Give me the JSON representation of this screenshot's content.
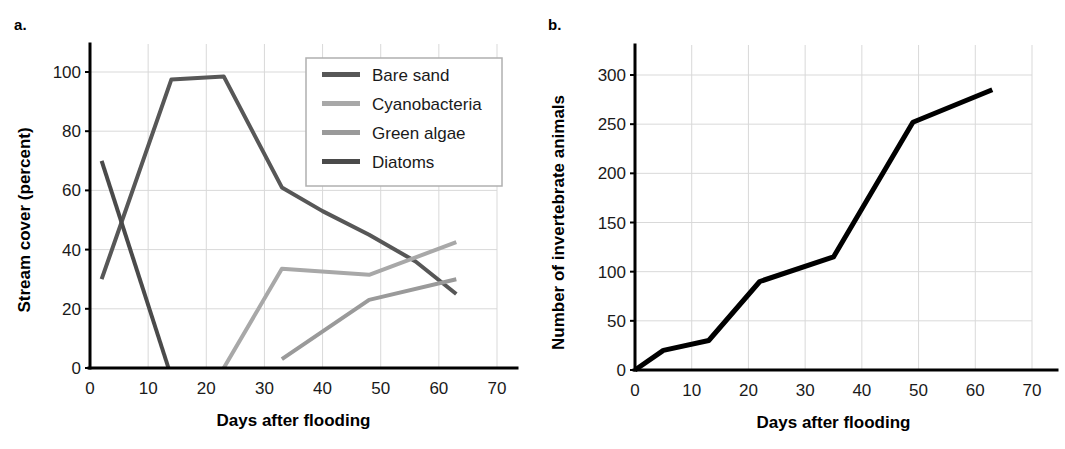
{
  "figure": {
    "panel_a_label": "a.",
    "panel_b_label": "b."
  },
  "chart_data": [
    {
      "panel": "a.",
      "type": "line",
      "title": "",
      "xlabel": "Days after flooding",
      "ylabel": "Stream cover (percent)",
      "xlim": [
        0,
        70
      ],
      "ylim": [
        0,
        100
      ],
      "xticks": [
        0,
        10,
        20,
        30,
        40,
        50,
        60,
        70
      ],
      "yticks": [
        0,
        20,
        40,
        60,
        80,
        100
      ],
      "xtick_labels": [
        "0",
        "10",
        "20",
        "30",
        "40",
        "50",
        "60",
        "70"
      ],
      "ytick_labels": [
        "0",
        "20",
        "40",
        "60",
        "80",
        "100"
      ],
      "grid": true,
      "legend_position": "upper-right",
      "series": [
        {
          "name": "Bare sand",
          "color": "#575757",
          "width": 4,
          "x": [
            2,
            14,
            23,
            33,
            40,
            48,
            56,
            63
          ],
          "y": [
            30,
            97.5,
            98.5,
            61,
            53,
            45,
            36,
            25
          ]
        },
        {
          "name": "Cyanobacteria",
          "color": "#a8a8a8",
          "width": 4,
          "x": [
            23,
            33,
            48,
            63
          ],
          "y": [
            0,
            33.5,
            31.5,
            42.5
          ]
        },
        {
          "name": "Green algae",
          "color": "#9a9a9a",
          "width": 4,
          "x": [
            33,
            48,
            63
          ],
          "y": [
            3,
            23,
            30
          ]
        },
        {
          "name": "Diatoms",
          "color": "#4a4a4a",
          "width": 4,
          "x": [
            2,
            13.5
          ],
          "y": [
            70,
            0
          ]
        }
      ]
    },
    {
      "panel": "b.",
      "type": "line",
      "title": "",
      "xlabel": "Days after flooding",
      "ylabel": "Number of invertebrate animals",
      "xlim": [
        0,
        70
      ],
      "ylim": [
        0,
        300
      ],
      "xticks": [
        0,
        10,
        20,
        30,
        40,
        50,
        60,
        70
      ],
      "yticks": [
        0,
        50,
        100,
        150,
        200,
        250,
        300
      ],
      "xtick_labels": [
        "0",
        "10",
        "20",
        "30",
        "40",
        "50",
        "60",
        "70"
      ],
      "ytick_labels": [
        "0",
        "50",
        "100",
        "150",
        "200",
        "250",
        "300"
      ],
      "grid": true,
      "legend_position": "none",
      "series": [
        {
          "name": "Invertebrate animals",
          "color": "#000000",
          "width": 5,
          "x": [
            0,
            5,
            13,
            22,
            35,
            49,
            63
          ],
          "y": [
            0,
            20,
            30,
            90,
            115,
            252,
            285
          ]
        }
      ]
    }
  ]
}
